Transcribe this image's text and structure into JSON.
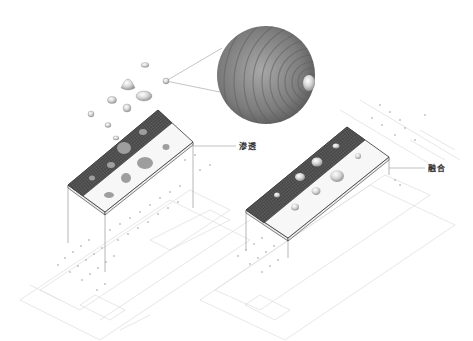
{
  "diagram": {
    "type": "axonometric architectural concept diagram",
    "labels": {
      "left": "渗透",
      "right": "融合"
    },
    "colors": {
      "roof_grid": "#4a4a4a",
      "slab_white": "#f6f6f6",
      "outline": "#333333",
      "plan_lines": "#d8d8d8",
      "droplet": "#b5b5b5",
      "sphere": "#8a8a8a"
    },
    "parts": [
      "magnified-sphere",
      "floating-droplets",
      "left-building-roof-slab",
      "right-building-roof-slab",
      "left-floor-plan",
      "right-floor-plan"
    ]
  }
}
